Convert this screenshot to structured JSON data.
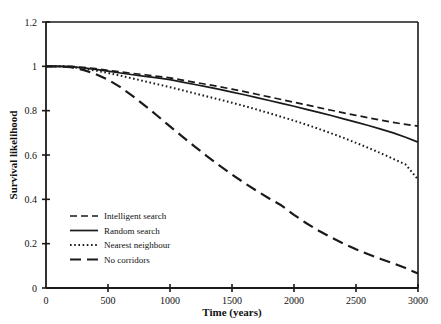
{
  "chart_data": {
    "type": "line",
    "title": "",
    "xlabel": "Time (years)",
    "ylabel": "Survival likelihood",
    "xlim": [
      0,
      3000
    ],
    "ylim": [
      0,
      1.2
    ],
    "xticks": [
      0,
      500,
      1000,
      1500,
      2000,
      2500,
      3000
    ],
    "xtick_labels": [
      "0",
      "500",
      "1000",
      "1500",
      "2000",
      "2500",
      "3000"
    ],
    "yticks": [
      0,
      0.2,
      0.4,
      0.6,
      0.8,
      1,
      1.2
    ],
    "ytick_labels": [
      "0",
      "0.2",
      "0.4",
      "0.6",
      "0.8",
      "1",
      "1.2"
    ],
    "grid": false,
    "legend_position": "lower-left-inside",
    "x": [
      0,
      100,
      200,
      300,
      400,
      500,
      600,
      700,
      800,
      900,
      1000,
      1100,
      1200,
      1300,
      1400,
      1500,
      1600,
      1700,
      1800,
      1900,
      2000,
      2100,
      2200,
      2300,
      2400,
      2500,
      2600,
      2700,
      2800,
      2900,
      3000
    ],
    "series": [
      {
        "name": "Intelligent search",
        "style": "dashed",
        "color": "#1a1a1a",
        "values": [
          1.0,
          1.0,
          1.0,
          0.995,
          0.99,
          0.982,
          0.975,
          0.968,
          0.962,
          0.955,
          0.948,
          0.938,
          0.928,
          0.918,
          0.908,
          0.897,
          0.886,
          0.874,
          0.862,
          0.85,
          0.838,
          0.826,
          0.814,
          0.802,
          0.79,
          0.779,
          0.768,
          0.757,
          0.747,
          0.738,
          0.73
        ]
      },
      {
        "name": "Random search",
        "style": "solid",
        "color": "#1a1a1a",
        "values": [
          1.0,
          1.0,
          0.999,
          0.993,
          0.986,
          0.978,
          0.97,
          0.962,
          0.955,
          0.948,
          0.94,
          0.929,
          0.918,
          0.907,
          0.896,
          0.884,
          0.872,
          0.859,
          0.846,
          0.833,
          0.82,
          0.806,
          0.792,
          0.778,
          0.763,
          0.748,
          0.733,
          0.717,
          0.7,
          0.68,
          0.658
        ]
      },
      {
        "name": "Nearest neighbour",
        "style": "dotted",
        "color": "#1a1a1a",
        "values": [
          1.0,
          1.0,
          0.998,
          0.99,
          0.981,
          0.97,
          0.958,
          0.945,
          0.932,
          0.919,
          0.906,
          0.892,
          0.878,
          0.864,
          0.85,
          0.836,
          0.821,
          0.805,
          0.789,
          0.772,
          0.755,
          0.737,
          0.718,
          0.698,
          0.677,
          0.655,
          0.632,
          0.608,
          0.583,
          0.557,
          0.49
        ]
      },
      {
        "name": "No corridors",
        "style": "longdash",
        "color": "#1a1a1a",
        "values": [
          1.0,
          1.0,
          0.996,
          0.984,
          0.965,
          0.94,
          0.906,
          0.866,
          0.822,
          0.776,
          0.729,
          0.683,
          0.638,
          0.594,
          0.552,
          0.512,
          0.474,
          0.438,
          0.404,
          0.372,
          0.33,
          0.292,
          0.258,
          0.228,
          0.2,
          0.175,
          0.152,
          0.131,
          0.111,
          0.09,
          0.065
        ]
      }
    ]
  },
  "legend": {
    "entries": [
      {
        "label": "Intelligent search",
        "style": "dashed"
      },
      {
        "label": "Random search",
        "style": "solid"
      },
      {
        "label": "Nearest neighbour",
        "style": "dotted"
      },
      {
        "label": "No corridors",
        "style": "longdash"
      }
    ]
  },
  "colors": {
    "ink": "#1a1a1a",
    "background": "#ffffff"
  }
}
